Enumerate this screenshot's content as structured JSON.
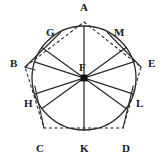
{
  "figure": {
    "type": "geometric-diagram",
    "canvas": {
      "width": 167,
      "height": 162
    },
    "colors": {
      "background": "#ffffff",
      "stroke": "#2b2b2b",
      "dashed_stroke": "#2b2b2b",
      "label_text": "#1a1a1a",
      "center_marker": "#111111"
    },
    "circle": {
      "center_label": "F",
      "cx": 84,
      "cy": 78,
      "r": 52,
      "style": "solid"
    },
    "center": {
      "label": "F",
      "x": 84,
      "y": 78,
      "label_x": 79,
      "label_y": 62,
      "marker": "filled-square"
    },
    "pentagon": {
      "style": "dashed",
      "vertices": [
        {
          "label": "A",
          "x": 84,
          "y": 22,
          "label_x": 80,
          "label_y": 2,
          "position": "top"
        },
        {
          "label": "B",
          "x": 25,
          "y": 67,
          "label_x": 10,
          "label_y": 58,
          "position": "upper-left"
        },
        {
          "label": "C",
          "x": 44,
          "y": 128,
          "label_x": 36,
          "label_y": 143,
          "position": "lower-left"
        },
        {
          "label": "D",
          "x": 123,
          "y": 128,
          "label_x": 122,
          "label_y": 143,
          "position": "lower-right"
        },
        {
          "label": "E",
          "x": 141,
          "y": 67,
          "label_x": 148,
          "label_y": 58,
          "position": "upper-right"
        }
      ]
    },
    "circle_points": [
      {
        "label": "A",
        "x": 84,
        "y": 26,
        "angle_deg": 90,
        "labeled": false
      },
      {
        "label": "G",
        "x": 53.5,
        "y": 36.0,
        "angle_deg": 126,
        "labeled": true,
        "label_x": 46,
        "label_y": 27
      },
      {
        "label": "M",
        "x": 114.5,
        "y": 36.0,
        "angle_deg": 54,
        "labeled": true,
        "label_x": 114,
        "label_y": 27
      },
      {
        "label": "H",
        "x": 34.5,
        "y": 62.0,
        "angle_deg": 162,
        "labeled": true,
        "label_x": 24,
        "label_y": 98
      },
      {
        "label": "L",
        "x": 133.5,
        "y": 62.0,
        "angle_deg": 18,
        "labeled": true,
        "label_x": 136,
        "label_y": 98
      },
      {
        "label": "K",
        "x": 84,
        "y": 130,
        "angle_deg": 270,
        "labeled": true,
        "label_x": 80,
        "label_y": 143
      }
    ],
    "labels": [
      {
        "name": "label-A",
        "text": "A",
        "x": 80,
        "y": 2
      },
      {
        "name": "label-G",
        "text": "G",
        "x": 46,
        "y": 27
      },
      {
        "name": "label-M",
        "text": "M",
        "x": 114,
        "y": 27
      },
      {
        "name": "label-B",
        "text": "B",
        "x": 10,
        "y": 58
      },
      {
        "name": "label-E",
        "text": "E",
        "x": 148,
        "y": 58
      },
      {
        "name": "label-F",
        "text": "F",
        "x": 79,
        "y": 62
      },
      {
        "name": "label-H",
        "text": "H",
        "x": 24,
        "y": 98
      },
      {
        "name": "label-L",
        "text": "L",
        "x": 136,
        "y": 98
      },
      {
        "name": "label-C",
        "text": "C",
        "x": 36,
        "y": 143
      },
      {
        "name": "label-K",
        "text": "K",
        "x": 80,
        "y": 143
      },
      {
        "name": "label-D",
        "text": "D",
        "x": 122,
        "y": 143
      }
    ],
    "radii_count": 10,
    "diameters_count": 5
  }
}
